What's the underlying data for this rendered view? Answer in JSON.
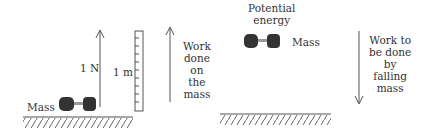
{
  "left_panel": {
    "mass_label": "Mass",
    "force_label": "1 N",
    "height_label": "1 m",
    "work_label": [
      "Work",
      "done",
      "on",
      "the",
      "mass"
    ]
  },
  "right_panel": {
    "pe_label": [
      "Potential",
      "energy"
    ],
    "mass_label": "Mass",
    "work_label": [
      "Work to",
      "be done",
      "by",
      "falling",
      "mass"
    ]
  },
  "colors": {
    "line": "#555555",
    "mass": "#333333",
    "text": "#333333"
  }
}
